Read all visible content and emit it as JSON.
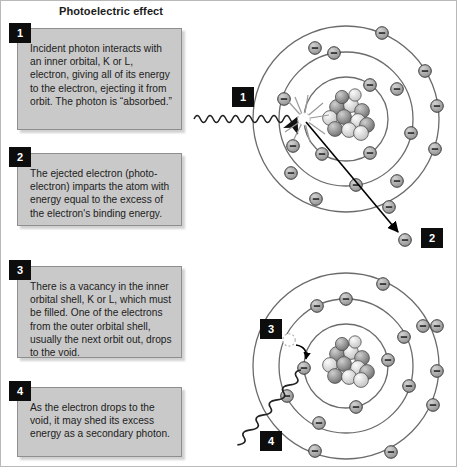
{
  "title": "Photoelectric effect",
  "steps": [
    {
      "number": "1",
      "text": "Incident photon interacts with an inner orbital, K or L, electron, giving all of its energy to the electron, ejecting it from orbit. The photon is “absorbed.”"
    },
    {
      "number": "2",
      "text": "The ejected electron (photo-electron) imparts the atom with energy equal to the excess of the electron's binding energy."
    },
    {
      "number": "3",
      "text": "There is a vacancy in the inner orbital shell, K or L, which must be filled. One of the electrons from the outer orbital shell, usually the next orbit out, drops to the void."
    },
    {
      "number": "4",
      "text": "As the electron drops to the void, it may shed its excess energy as a secondary photon."
    }
  ],
  "diagram_labels": {
    "incident_photon": "1",
    "ejected_electron": "2",
    "vacancy_fill": "3",
    "secondary_photon": "4"
  },
  "colors": {
    "card_fill": "#c9c9c9",
    "card_border": "#8e8e8e",
    "badge_fill": "#0d0d0d",
    "badge_text": "#ffffff",
    "orbit_stroke": "#6b6b6b",
    "electron_fill": "#a9a9a9",
    "electron_stroke": "#3a3a3a",
    "nucleus_dark": "#7d7d7d",
    "nucleus_light": "#e4e4e4",
    "wave_stroke": "#2b2b2b",
    "arrow_stroke": "#000000",
    "page_bg": "#ffffff"
  },
  "atoms": {
    "top": {
      "name": "photon-absorption-atom",
      "center": {
        "x": 345,
        "y": 118
      },
      "shells": [
        {
          "name": "inner-shell",
          "radius": 42,
          "electrons_deg": [
            -55,
            55,
            125,
            235
          ]
        },
        {
          "name": "middle-shell",
          "radius": 67,
          "electrons_deg": [
            -100,
            -40,
            20,
            80,
            140,
            200
          ]
        },
        {
          "name": "outer-shell",
          "radius": 93,
          "electrons_deg": [
            -108,
            -60,
            -20,
            20,
            62,
            108,
            150,
            200,
            250
          ]
        }
      ],
      "nucleus_radius": 22,
      "vacancy": {
        "x": 303,
        "y": 118
      },
      "photon_wave": {
        "x1": 193,
        "y1": 118,
        "x2": 296,
        "y2": 118
      },
      "ejection_arrow": {
        "x1": 307,
        "y1": 122,
        "x2": 398,
        "y2": 232
      },
      "free_electron": {
        "x": 404,
        "y": 238
      }
    },
    "bottom": {
      "name": "vacancy-fill-atom",
      "center": {
        "x": 345,
        "y": 365
      },
      "shells": [
        {
          "name": "inner-shell",
          "radius": 42,
          "electrons_deg": [
            180,
            0,
            100,
            230
          ]
        },
        {
          "name": "middle-shell",
          "radius": 67,
          "electrons_deg": [
            -100,
            -40,
            20,
            80,
            140,
            200
          ]
        },
        {
          "name": "outer-shell",
          "radius": 93,
          "electrons_deg": [
            -108,
            -60,
            -20,
            20,
            62,
            108,
            150,
            200,
            250
          ]
        }
      ],
      "nucleus_radius": 22,
      "vacancy": {
        "x": 288,
        "y": 339
      },
      "drop_arrow": {
        "x1": 296,
        "y1": 345,
        "x2": 312,
        "y2": 360
      },
      "photon_wave": {
        "x1": 300,
        "y1": 368,
        "x2": 222,
        "y2": 448
      }
    }
  }
}
